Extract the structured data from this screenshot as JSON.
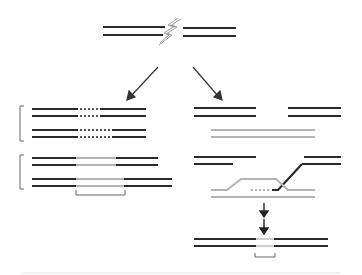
{
  "diagram": {
    "title": "",
    "colors": {
      "strand_dark": "#2a2a2a",
      "strand_light": "#b4b4b4",
      "arrow": "#333333",
      "bracket": "#666666",
      "lightning": "#9a9a9a",
      "divider": "#e4e4e4"
    },
    "icons": [
      "lightning-bolt-icon",
      "arrow-down-left-icon",
      "arrow-down-right-icon",
      "arrow-down-icon"
    ],
    "panels": [
      {
        "name": "broken-dna",
        "description": "Double-stranded DNA with double-strand break"
      },
      {
        "name": "left-pathway",
        "description": "Two outcome pairs with deletions (dotted) and insertions (light gray) bracketed"
      },
      {
        "name": "right-pathway",
        "description": "Broken ends with homologous template, strand invasion, and repaired product"
      }
    ]
  }
}
